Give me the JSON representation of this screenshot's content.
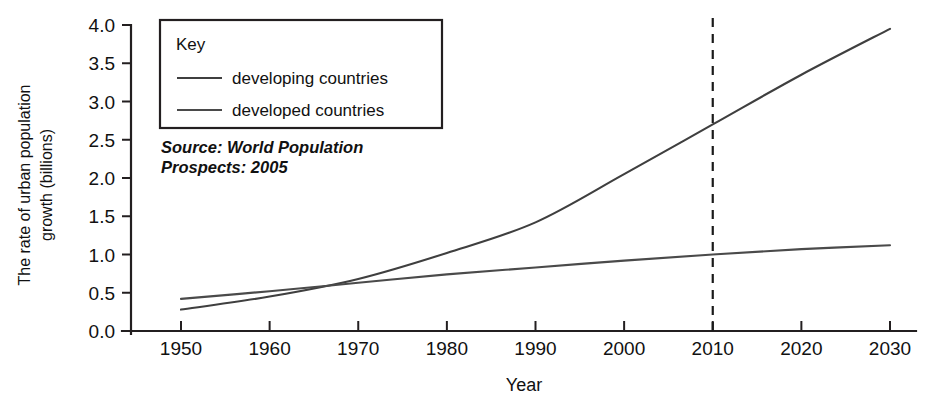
{
  "chart_data": {
    "type": "line",
    "title": "",
    "xlabel": "Year",
    "ylabel": "The rate of urban population growth (billions)",
    "ylabel_line1": "The rate of urban population",
    "ylabel_line2": "growth (billions)",
    "xlim": [
      1945,
      1948.9
    ],
    "x_axis_min": 1945,
    "x_axis_max": 2034,
    "ylim": [
      0.0,
      4.0
    ],
    "grid": false,
    "x_ticks": [
      1950,
      1960,
      1970,
      1980,
      1990,
      2000,
      2010,
      2020,
      2030
    ],
    "x_tick_labels": [
      "1950",
      "1960",
      "1970",
      "1980",
      "1990",
      "2000",
      "2010",
      "2020",
      "2030"
    ],
    "y_ticks": [
      0.0,
      0.5,
      1.0,
      1.5,
      2.0,
      2.5,
      3.0,
      3.5,
      4.0
    ],
    "y_tick_labels": [
      "0.0",
      "0.5",
      "1.0",
      "1.5",
      "2.0",
      "2.5",
      "3.0",
      "3.5",
      "4.0"
    ],
    "x": [
      1950,
      1960,
      1970,
      1980,
      1990,
      2000,
      2010,
      2020,
      2030
    ],
    "series": [
      {
        "name": "developing countries",
        "color": "#3f3f3f",
        "values": [
          0.28,
          0.45,
          0.68,
          1.02,
          1.42,
          2.05,
          2.7,
          3.35,
          3.95
        ]
      },
      {
        "name": "developed countries",
        "color": "#4a4a4a",
        "values": [
          0.42,
          0.52,
          0.63,
          0.74,
          0.83,
          0.92,
          1.0,
          1.07,
          1.12
        ]
      }
    ],
    "annotations": [
      {
        "name": "year-2010-marker",
        "type": "vertical-dashed-line",
        "x": 2010,
        "y_from": 0.0,
        "y_to": 4.17,
        "label": ""
      }
    ],
    "legend": {
      "position": "top-left-inset",
      "title": "Key",
      "entries": [
        "developing countries",
        "developed countries"
      ]
    },
    "source_line1": "Source: World Population",
    "source_line2": "Prospects: 2005",
    "crossover_note": "lines cross near 1968 at about 0.65 billion"
  }
}
